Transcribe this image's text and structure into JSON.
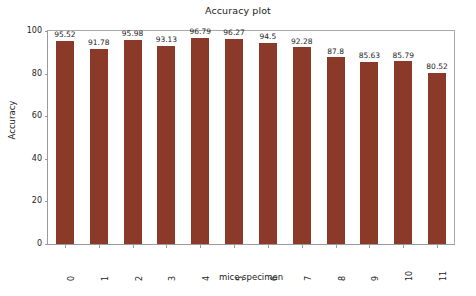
{
  "chart_data": {
    "type": "bar",
    "title": "Accuracy plot",
    "xlabel": "mice specimen",
    "ylabel": "Accuracy",
    "categories": [
      "0",
      "1",
      "2",
      "3",
      "4",
      "5",
      "6",
      "7",
      "8",
      "9",
      "10",
      "11"
    ],
    "values": [
      95.52,
      91.78,
      95.98,
      93.13,
      96.79,
      96.27,
      94.5,
      92.28,
      87.8,
      85.63,
      85.79,
      80.52
    ],
    "value_labels": [
      "95.52",
      "91.78",
      "95.98",
      "93.13",
      "96.79",
      "96.27",
      "94.5",
      "92.28",
      "87.8",
      "85.63",
      "85.79",
      "80.52"
    ],
    "ylim": [
      0,
      100
    ],
    "yticks": [
      0,
      20,
      40,
      60,
      80,
      100
    ],
    "ytick_labels": [
      "0",
      "20",
      "40",
      "60",
      "80",
      "100"
    ],
    "xtick_rotation": 90,
    "grid": false,
    "legend": null,
    "bar_color": "#8B3A2A",
    "background_color": "#ffffff",
    "axis_color": "#9a9a9a",
    "text_color": "#1c1c1c"
  }
}
